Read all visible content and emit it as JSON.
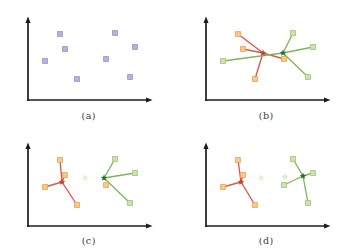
{
  "figure": {
    "background": "#ffffff",
    "description_visible_panels": 4
  },
  "styles": {
    "lavender": {
      "fill": "#b5b5db",
      "stroke": "#9a9acc"
    },
    "orange": {
      "fill": "#f8ca8c",
      "stroke": "#eda75c"
    },
    "green": {
      "fill": "#cee3b1",
      "stroke": "#a2c979"
    },
    "red_centroid": "#c93d2c",
    "green_centroid": "#2e6b30",
    "red_edge": "#d95844",
    "green_edge": "#7cb65c",
    "ghost-cream": "#efecd6",
    "ghost-green": "#dcead0",
    "axis": "#1c1c1c",
    "caption": "#3a3a3a"
  },
  "chart_data": [
    {
      "id": "a",
      "type": "scatter",
      "label": "(a)",
      "points": [
        {
          "x": 32,
          "y": 66,
          "cls": "lavender"
        },
        {
          "x": 87,
          "y": 67,
          "cls": "lavender"
        },
        {
          "x": 37,
          "y": 51,
          "cls": "lavender"
        },
        {
          "x": 107,
          "y": 53,
          "cls": "lavender"
        },
        {
          "x": 17,
          "y": 39,
          "cls": "lavender"
        },
        {
          "x": 78,
          "y": 41,
          "cls": "lavender"
        },
        {
          "x": 49,
          "y": 21,
          "cls": "lavender"
        },
        {
          "x": 102,
          "y": 23,
          "cls": "lavender"
        }
      ],
      "centroids": [],
      "edges": [],
      "ghosts": []
    },
    {
      "id": "b",
      "type": "scatter",
      "label": "(b)",
      "points": [
        {
          "x": 32,
          "y": 66,
          "cls": "orange"
        },
        {
          "x": 87,
          "y": 67,
          "cls": "green"
        },
        {
          "x": 37,
          "y": 51,
          "cls": "orange"
        },
        {
          "x": 107,
          "y": 53,
          "cls": "green"
        },
        {
          "x": 17,
          "y": 39,
          "cls": "green"
        },
        {
          "x": 78,
          "y": 41,
          "cls": "orange"
        },
        {
          "x": 49,
          "y": 21,
          "cls": "orange"
        },
        {
          "x": 102,
          "y": 23,
          "cls": "green"
        }
      ],
      "centroids": [
        {
          "id": "red",
          "x": 57,
          "y": 47
        },
        {
          "id": "green",
          "x": 77,
          "y": 47
        }
      ],
      "edges": [
        {
          "from": "red",
          "to": 0
        },
        {
          "from": "red",
          "to": 2
        },
        {
          "from": "red",
          "to": 5
        },
        {
          "from": "red",
          "to": 6
        },
        {
          "from": "green",
          "to": 1
        },
        {
          "from": "green",
          "to": 3
        },
        {
          "from": "green",
          "to": 4
        },
        {
          "from": "green",
          "to": 7
        }
      ],
      "ghosts": []
    },
    {
      "id": "c",
      "type": "scatter",
      "label": "(c)",
      "points": [
        {
          "x": 32,
          "y": 66,
          "cls": "orange"
        },
        {
          "x": 87,
          "y": 67,
          "cls": "green"
        },
        {
          "x": 37,
          "y": 51,
          "cls": "orange"
        },
        {
          "x": 107,
          "y": 53,
          "cls": "green"
        },
        {
          "x": 17,
          "y": 39,
          "cls": "orange"
        },
        {
          "x": 78,
          "y": 41,
          "cls": "orange"
        },
        {
          "x": 49,
          "y": 21,
          "cls": "orange"
        },
        {
          "x": 102,
          "y": 23,
          "cls": "green"
        }
      ],
      "centroids": [
        {
          "id": "red",
          "x": 34,
          "y": 44
        },
        {
          "id": "green",
          "x": 76,
          "y": 48
        }
      ],
      "edges": [
        {
          "from": "red",
          "to": 0
        },
        {
          "from": "red",
          "to": 2
        },
        {
          "from": "red",
          "to": 4
        },
        {
          "from": "red",
          "to": 6
        },
        {
          "from": "green",
          "to": 1
        },
        {
          "from": "green",
          "to": 3
        },
        {
          "from": "green",
          "to": 7
        }
      ],
      "ghosts": [
        {
          "x": 57,
          "y": 48,
          "cls": "ghost-cream"
        }
      ]
    },
    {
      "id": "d",
      "type": "scatter",
      "label": "(d)",
      "points": [
        {
          "x": 32,
          "y": 66,
          "cls": "orange"
        },
        {
          "x": 87,
          "y": 67,
          "cls": "green"
        },
        {
          "x": 37,
          "y": 51,
          "cls": "orange"
        },
        {
          "x": 107,
          "y": 53,
          "cls": "green"
        },
        {
          "x": 17,
          "y": 39,
          "cls": "orange"
        },
        {
          "x": 78,
          "y": 41,
          "cls": "green"
        },
        {
          "x": 49,
          "y": 21,
          "cls": "orange"
        },
        {
          "x": 102,
          "y": 23,
          "cls": "green"
        }
      ],
      "centroids": [
        {
          "id": "red",
          "x": 35,
          "y": 44
        },
        {
          "id": "green",
          "x": 97,
          "y": 50
        }
      ],
      "edges": [
        {
          "from": "red",
          "to": 0
        },
        {
          "from": "red",
          "to": 2
        },
        {
          "from": "red",
          "to": 4
        },
        {
          "from": "red",
          "to": 6
        },
        {
          "from": "green",
          "to": 1
        },
        {
          "from": "green",
          "to": 3
        },
        {
          "from": "green",
          "to": 5
        },
        {
          "from": "green",
          "to": 7
        }
      ],
      "ghosts": [
        {
          "x": 55,
          "y": 48,
          "cls": "ghost-cream"
        },
        {
          "x": 79,
          "y": 49,
          "cls": "ghost-green"
        }
      ]
    }
  ]
}
